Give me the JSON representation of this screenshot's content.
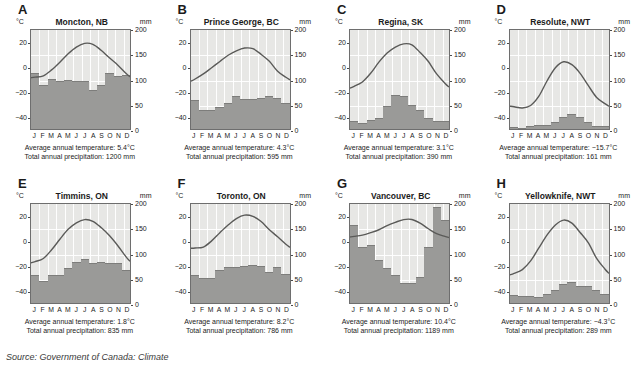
{
  "figure": {
    "source_label": "Source:",
    "source_text": " Government of Canada: Climate",
    "temp_unit": "°C",
    "precip_unit": "mm",
    "months": [
      "J",
      "F",
      "M",
      "A",
      "M",
      "J",
      "J",
      "A",
      "S",
      "O",
      "N",
      "D"
    ],
    "temp_ticks": [
      "20",
      "0",
      "−20",
      "−40"
    ],
    "precip_ticks": [
      "200",
      "150",
      "100",
      "50",
      "0"
    ],
    "bar_color": "#9a9a98",
    "plot_bg": "#e7e7e5",
    "curve_color": "#5a5a58",
    "grid_color": "#ffffff"
  },
  "chart_data": [
    {
      "type": "bar",
      "panel": "A",
      "title": "Moncton, NB",
      "xlabel": "",
      "ylabel": "mm",
      "ylim": [
        0,
        200
      ],
      "y2label": "°C",
      "y2lim": [
        -50,
        30
      ],
      "categories": [
        "J",
        "F",
        "M",
        "A",
        "M",
        "J",
        "J",
        "A",
        "S",
        "O",
        "N",
        "D"
      ],
      "series": [
        {
          "name": "Precipitation (mm)",
          "values": [
            110,
            88,
            100,
            95,
            97,
            95,
            95,
            78,
            88,
            110,
            105,
            107
          ]
        },
        {
          "name": "Temperature (°C)",
          "values": [
            -8.1,
            -7.0,
            -2.2,
            4.0,
            10.8,
            16.2,
            19.2,
            18.4,
            13.6,
            7.5,
            1.8,
            -5.0
          ]
        }
      ],
      "avg_temp_label": "Average annual temperature: 5.4°C",
      "total_precip_label": "Total annual precipitation: 1200 mm"
    },
    {
      "type": "bar",
      "panel": "B",
      "title": "Prince George, BC",
      "xlabel": "",
      "ylabel": "mm",
      "ylim": [
        0,
        200
      ],
      "y2label": "°C",
      "y2lim": [
        -50,
        30
      ],
      "categories": [
        "J",
        "F",
        "M",
        "A",
        "M",
        "J",
        "J",
        "A",
        "S",
        "O",
        "N",
        "D"
      ],
      "series": [
        {
          "name": "Precipitation (mm)",
          "values": [
            57,
            38,
            37,
            44,
            52,
            65,
            60,
            60,
            62,
            65,
            61,
            52
          ]
        },
        {
          "name": "Temperature (°C)",
          "values": [
            -9.6,
            -5.5,
            -0.5,
            4.6,
            9.6,
            13.2,
            15.4,
            14.9,
            10.3,
            4.7,
            -3.3,
            -8.2
          ]
        }
      ],
      "avg_temp_label": "Average annual temperature: 4.3°C",
      "total_precip_label": "Total annual precipitation: 595 mm"
    },
    {
      "type": "bar",
      "panel": "C",
      "title": "Regina, SK",
      "xlabel": "",
      "ylabel": "mm",
      "ylim": [
        0,
        200
      ],
      "y2label": "°C",
      "y2lim": [
        -50,
        30
      ],
      "categories": [
        "J",
        "F",
        "M",
        "A",
        "M",
        "J",
        "J",
        "A",
        "S",
        "O",
        "N",
        "D"
      ],
      "series": [
        {
          "name": "Precipitation (mm)",
          "values": [
            15,
            11,
            18,
            21,
            45,
            68,
            65,
            48,
            38,
            22,
            15,
            16
          ]
        },
        {
          "name": "Temperature (°C)",
          "values": [
            -15.5,
            -12.0,
            -5.0,
            4.0,
            11.4,
            16.2,
            18.8,
            18.0,
            11.8,
            4.5,
            -5.5,
            -13.0
          ]
        }
      ],
      "avg_temp_label": "Average annual temperature: 3.1°C",
      "total_precip_label": "Total annual precipitation: 390 mm"
    },
    {
      "type": "bar",
      "panel": "D",
      "title": "Resolute, NWT",
      "xlabel": "",
      "ylabel": "mm",
      "ylim": [
        0,
        200
      ],
      "y2label": "°C",
      "y2lim": [
        -50,
        30
      ],
      "categories": [
        "J",
        "F",
        "M",
        "A",
        "M",
        "J",
        "J",
        "A",
        "S",
        "O",
        "N",
        "D"
      ],
      "series": [
        {
          "name": "Precipitation (mm)",
          "values": [
            4,
            3,
            6,
            7,
            8,
            13,
            23,
            30,
            24,
            14,
            6,
            5
          ]
        },
        {
          "name": "Temperature (°C)",
          "values": [
            -32.0,
            -33.0,
            -31.0,
            -23.5,
            -11.0,
            -0.5,
            4.3,
            2.0,
            -5.0,
            -15.0,
            -24.5,
            -29.5
          ]
        }
      ],
      "avg_temp_label": "Average annual temperature: −15.7°C",
      "total_precip_label": "Total annual precipitation: 161 mm"
    },
    {
      "type": "bar",
      "panel": "E",
      "title": "Timmins, ON",
      "xlabel": "",
      "ylabel": "mm",
      "ylim": [
        0,
        200
      ],
      "y2label": "°C",
      "y2lim": [
        -50,
        30
      ],
      "categories": [
        "J",
        "F",
        "M",
        "A",
        "M",
        "J",
        "J",
        "A",
        "S",
        "O",
        "N",
        "D"
      ],
      "series": [
        {
          "name": "Precipitation (mm)",
          "values": [
            55,
            44,
            56,
            56,
            70,
            82,
            88,
            80,
            82,
            80,
            80,
            66
          ]
        },
        {
          "name": "Temperature (°C)",
          "values": [
            -16.5,
            -14.0,
            -7.0,
            1.5,
            9.5,
            14.8,
            17.4,
            16.0,
            11.0,
            4.5,
            -3.5,
            -12.5
          ]
        }
      ],
      "avg_temp_label": "Average annual temperature: 1.8°C",
      "total_precip_label": "Total annual precipitation: 835 mm"
    },
    {
      "type": "bar",
      "panel": "F",
      "title": "Toronto, ON",
      "xlabel": "",
      "ylabel": "mm",
      "ylim": [
        0,
        200
      ],
      "y2label": "°C",
      "y2lim": [
        -50,
        30
      ],
      "categories": [
        "J",
        "F",
        "M",
        "A",
        "M",
        "J",
        "J",
        "A",
        "S",
        "O",
        "N",
        "D"
      ],
      "series": [
        {
          "name": "Precipitation (mm)",
          "values": [
            55,
            50,
            50,
            66,
            72,
            72,
            74,
            76,
            74,
            62,
            72,
            58
          ]
        },
        {
          "name": "Temperature (°C)",
          "values": [
            -5.5,
            -4.8,
            0.2,
            6.8,
            13.0,
            18.2,
            21.0,
            20.0,
            15.8,
            9.2,
            3.5,
            -2.5
          ]
        }
      ],
      "avg_temp_label": "Average annual temperature: 8.2°C",
      "total_precip_label": "Total annual precipitation: 786 mm"
    },
    {
      "type": "bar",
      "panel": "G",
      "title": "Vancouver, BC",
      "xlabel": "",
      "ylabel": "mm",
      "ylim": [
        0,
        200
      ],
      "y2label": "°C",
      "y2lim": [
        -50,
        30
      ],
      "categories": [
        "J",
        "F",
        "M",
        "A",
        "M",
        "J",
        "J",
        "A",
        "S",
        "O",
        "N",
        "D"
      ],
      "series": [
        {
          "name": "Precipitation (mm)",
          "values": [
            155,
            110,
            115,
            85,
            70,
            55,
            40,
            40,
            52,
            110,
            190,
            165
          ]
        },
        {
          "name": "Temperature (°C)",
          "values": [
            3.8,
            4.8,
            6.8,
            9.2,
            12.6,
            15.2,
            17.4,
            17.5,
            14.5,
            10.0,
            6.0,
            3.8
          ]
        }
      ],
      "avg_temp_label": "Average annual temperature: 10.4°C",
      "total_precip_label": "Total annual precipitation: 1189 mm"
    },
    {
      "type": "bar",
      "panel": "H",
      "title": "Yellowknife, NWT",
      "xlabel": "",
      "ylabel": "mm",
      "ylim": [
        0,
        200
      ],
      "y2label": "°C",
      "y2lim": [
        -50,
        30
      ],
      "categories": [
        "J",
        "F",
        "M",
        "A",
        "M",
        "J",
        "J",
        "A",
        "S",
        "O",
        "N",
        "D"
      ],
      "series": [
        {
          "name": "Precipitation (mm)",
          "values": [
            15,
            14,
            14,
            11,
            18,
            26,
            38,
            41,
            34,
            33,
            25,
            18
          ]
        },
        {
          "name": "Temperature (°C)",
          "values": [
            -26.0,
            -23.0,
            -16.0,
            -5.5,
            5.0,
            13.0,
            17.0,
            14.5,
            7.0,
            -1.5,
            -14.0,
            -22.5
          ]
        }
      ],
      "avg_temp_label": "Average annual temperature: −4.3°C",
      "total_precip_label": "Total annual precipitation: 289 mm"
    }
  ]
}
